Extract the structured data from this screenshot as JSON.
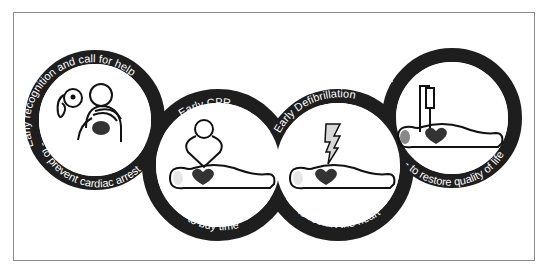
{
  "diagram": {
    "colors": {
      "ring": "#1e1e1e",
      "ring_text": "#ffffff",
      "heart": "#3a3a3a",
      "outline": "#111111",
      "head_fill": "#e6e6e6",
      "bolt_fill": "#d9d9d9",
      "frame": "#8a8a8a",
      "background": "#ffffff"
    },
    "links": [
      {
        "title": "Early recognition and call for help",
        "subtitle": "- to prevent cardiac arrest",
        "icon": "phone-call-rescuer-icon"
      },
      {
        "title": "Early CPR",
        "subtitle": "- to buy time",
        "icon": "chest-compression-icon"
      },
      {
        "title": "Early Defibrillation",
        "subtitle": "- to restart the heart",
        "icon": "defibrillation-bolt-icon"
      },
      {
        "title": "Post resuscitation care",
        "subtitle": "- to restore quality of life",
        "icon": "iv-drip-patient-icon"
      }
    ]
  }
}
